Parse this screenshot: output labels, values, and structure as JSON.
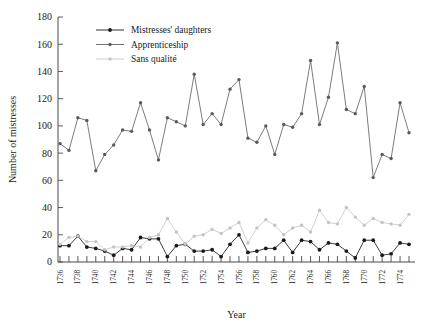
{
  "chart_data": {
    "type": "line",
    "title": "",
    "xlabel": "Year",
    "ylabel": "Number of mistresses",
    "xlim": [
      1736,
      1775
    ],
    "ylim": [
      0,
      180
    ],
    "ytick_step": 20,
    "yticks": [
      0,
      20,
      40,
      60,
      80,
      100,
      120,
      140,
      160,
      180
    ],
    "xticks_labeled": [
      1736,
      1738,
      1740,
      1742,
      1744,
      1746,
      1748,
      1750,
      1752,
      1754,
      1756,
      1758,
      1760,
      1762,
      1764,
      1766,
      1768,
      1770,
      1772,
      1774
    ],
    "xtick_minor_every": 1,
    "grid": false,
    "legend_position": "top-left-inside",
    "x": [
      1736,
      1737,
      1738,
      1739,
      1740,
      1741,
      1742,
      1743,
      1744,
      1745,
      1746,
      1747,
      1748,
      1749,
      1750,
      1751,
      1752,
      1753,
      1754,
      1755,
      1756,
      1757,
      1758,
      1759,
      1760,
      1761,
      1762,
      1763,
      1764,
      1765,
      1766,
      1767,
      1768,
      1769,
      1770,
      1771,
      1772,
      1773,
      1774,
      1775
    ],
    "series": [
      {
        "name": "Mistresses' daughters",
        "color": "#1a1a1a",
        "marker": "filled-circle",
        "values": [
          12,
          12,
          19,
          11,
          10,
          8,
          5,
          10,
          9,
          18,
          17,
          17,
          4,
          12,
          13,
          8,
          8,
          9,
          4,
          13,
          20,
          7,
          8,
          10,
          10,
          16,
          7,
          16,
          15,
          9,
          14,
          13,
          8,
          3,
          16,
          16,
          5,
          6,
          14,
          13
        ]
      },
      {
        "name": "Apprenticeship",
        "color": "#5a5a5a",
        "marker": "filled-circle",
        "values": [
          87,
          82,
          106,
          104,
          67,
          79,
          86,
          97,
          96,
          117,
          97,
          75,
          106,
          103,
          100,
          138,
          101,
          109,
          101,
          127,
          134,
          91,
          88,
          100,
          79,
          101,
          99,
          109,
          148,
          101,
          121,
          161,
          112,
          109,
          129,
          62,
          79,
          76,
          117,
          95
        ]
      },
      {
        "name": "Sans qualité",
        "color": "#c4c4c4",
        "marker": "filled-circle",
        "values": [
          13,
          18,
          19,
          15,
          15,
          9,
          11,
          11,
          12,
          11,
          18,
          20,
          32,
          22,
          13,
          19,
          20,
          24,
          21,
          25,
          29,
          14,
          25,
          31,
          27,
          20,
          25,
          27,
          22,
          38,
          29,
          28,
          40,
          33,
          27,
          32,
          29,
          28,
          27,
          35
        ]
      }
    ]
  },
  "legend": {
    "items": [
      {
        "label": "Mistresses' daughters"
      },
      {
        "label": "Apprenticeship"
      },
      {
        "label": "Sans qualité"
      }
    ]
  }
}
